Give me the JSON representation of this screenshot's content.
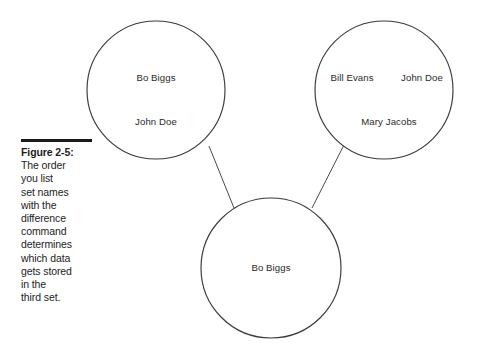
{
  "figure": {
    "caption_rule": "rule",
    "label": "Figure 2-5:",
    "caption_lines": [
      "The order",
      "you list",
      "set names",
      "with the",
      "difference",
      "command",
      "determines",
      "which data",
      "gets stored",
      "in the",
      "third set."
    ],
    "caption_full": "Figure 2-5: The order you list set names with the difference command determines which data gets stored in the third set."
  },
  "diagram": {
    "type": "set-difference-venn",
    "colors": {
      "circle_stroke": "#3a3a3a",
      "connector_stroke": "#4a4a4a",
      "text": "#2a2a2a",
      "caption_text": "#1d1d1d",
      "background": "#ffffff"
    },
    "sets": [
      {
        "name": "left-set",
        "position": "top-left",
        "center": {
          "x": 156,
          "y": 90
        },
        "radius": 69,
        "members": [
          {
            "text": "Bo Biggs",
            "x": 156,
            "y": 81
          },
          {
            "text": "John Doe",
            "x": 156,
            "y": 125
          }
        ]
      },
      {
        "name": "right-set",
        "position": "top-right",
        "center": {
          "x": 384,
          "y": 90
        },
        "radius": 69,
        "members": [
          {
            "text": "Bill Evans",
            "x": 352,
            "y": 81
          },
          {
            "text": "John Doe",
            "x": 422,
            "y": 81
          },
          {
            "text": "Mary Jacobs",
            "x": 389,
            "y": 125
          }
        ]
      },
      {
        "name": "result-set",
        "position": "bottom-center",
        "center": {
          "x": 271,
          "y": 268
        },
        "radius": 70,
        "members": [
          {
            "text": "Bo Biggs",
            "x": 271,
            "y": 271
          }
        ]
      }
    ],
    "connectors": [
      {
        "name": "left-to-result",
        "x1": 209,
        "y1": 146,
        "x2": 234,
        "y2": 208
      },
      {
        "name": "right-to-result",
        "x1": 348,
        "y1": 137,
        "x2": 312,
        "y2": 208
      }
    ]
  }
}
